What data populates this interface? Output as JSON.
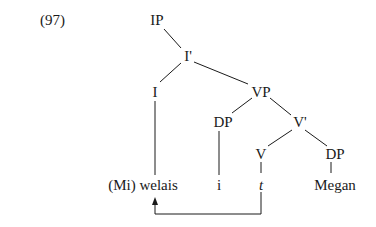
{
  "example_number": "(97)",
  "nodes": {
    "ip": "IP",
    "ibar": "I'",
    "i": "I",
    "vp": "VP",
    "dp_spec": "DP",
    "vbar": "V'",
    "v": "V",
    "dp_obj": "DP"
  },
  "leaves": {
    "i": "(Mi) welais",
    "dp_spec": "i",
    "v": "t",
    "dp_obj": "Megan"
  },
  "movement_arrow": {
    "from": "t",
    "to": "(Mi) welais"
  }
}
